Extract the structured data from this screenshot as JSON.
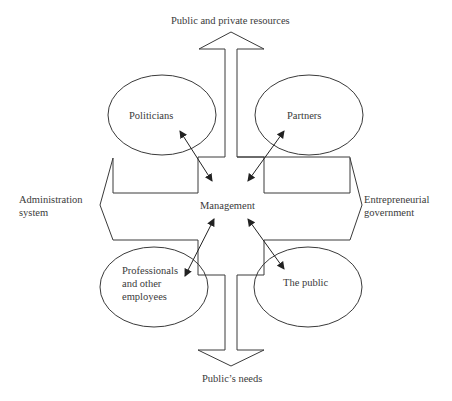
{
  "diagram": {
    "center": "Management",
    "arrows": {
      "up": "Public and private resources",
      "down": "Public’s needs",
      "left": [
        "Administration",
        "system"
      ],
      "right": [
        "Entrepreneurial",
        "government"
      ]
    },
    "nodes": [
      {
        "id": "politicians",
        "label": [
          "Politicians"
        ]
      },
      {
        "id": "partners",
        "label": [
          "Partners"
        ]
      },
      {
        "id": "professionals",
        "label": [
          "Professionals",
          "and other",
          "employees"
        ]
      },
      {
        "id": "public",
        "label": [
          "The public"
        ]
      }
    ],
    "relations": [
      {
        "from": "management",
        "to": "politicians",
        "type": "bidirectional"
      },
      {
        "from": "management",
        "to": "partners",
        "type": "bidirectional"
      },
      {
        "from": "management",
        "to": "professionals",
        "type": "bidirectional"
      },
      {
        "from": "management",
        "to": "public",
        "type": "bidirectional"
      }
    ],
    "colors": {
      "line": "#3a3a3a",
      "background": "#ffffff"
    }
  }
}
